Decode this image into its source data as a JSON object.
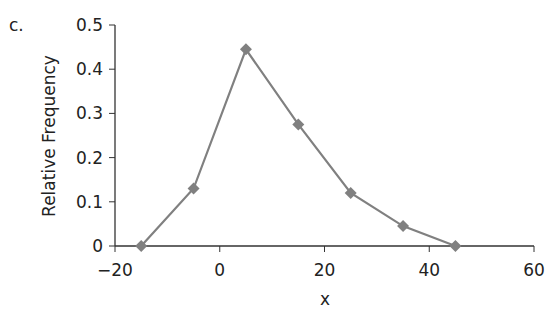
{
  "panel_label": "c.",
  "chart_data": {
    "type": "line",
    "title": "",
    "xlabel": "x",
    "ylabel": "Relative Frequency",
    "x": [
      -15,
      -5,
      5,
      15,
      25,
      35,
      45
    ],
    "series": [
      {
        "name": "Relative Frequency",
        "values": [
          0,
          0.13,
          0.445,
          0.275,
          0.12,
          0.045,
          0.0
        ],
        "color": "#808080",
        "marker": "diamond"
      }
    ],
    "xlim": [
      -20,
      60
    ],
    "ylim": [
      0,
      0.5
    ],
    "xticks": [
      "-20",
      "0",
      "20",
      "40",
      "60"
    ],
    "yticks": [
      "0",
      "0.1",
      "0.2",
      "0.3",
      "0.4",
      "0.5"
    ],
    "grid": false,
    "legend": null
  },
  "colors": {
    "line": "#808080",
    "axis": "#333333"
  }
}
